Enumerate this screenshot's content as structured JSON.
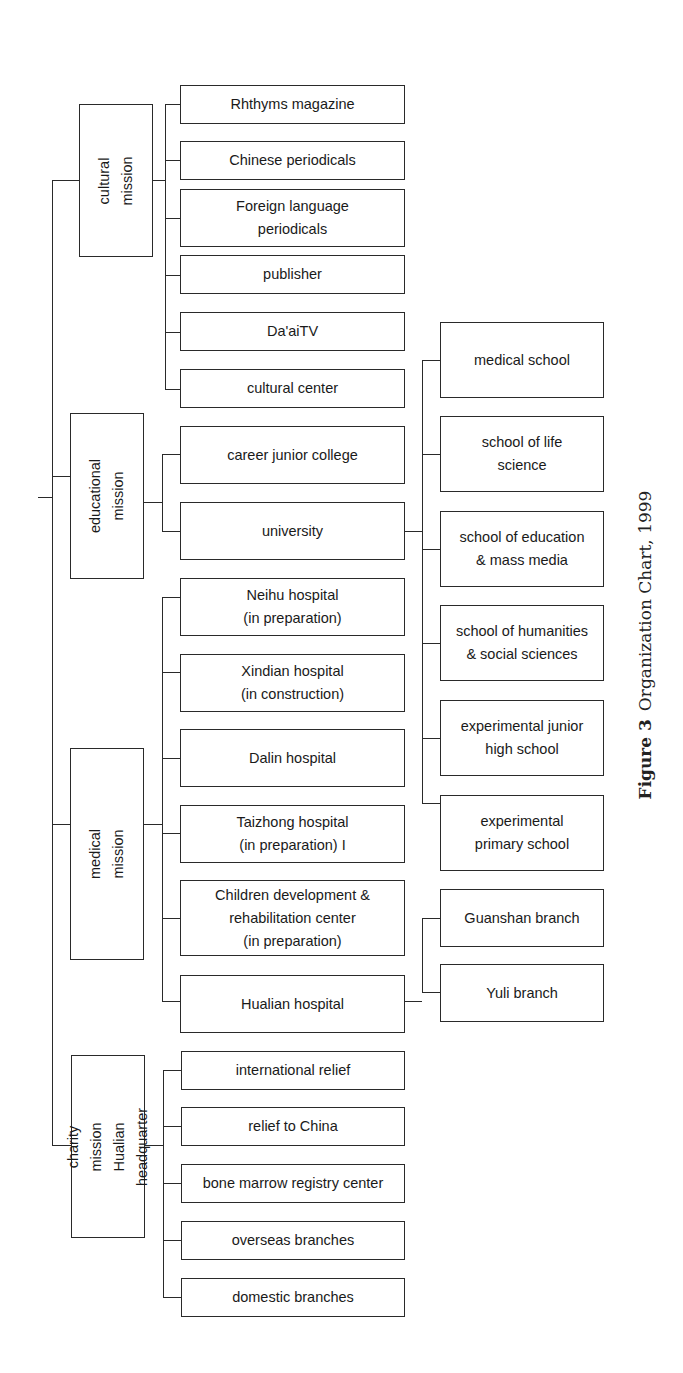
{
  "chart": {
    "caption": {
      "figure_label": "Figure 3",
      "title": "Organization Chart, 1999"
    },
    "missions": [
      {
        "id": "cultural",
        "label": "cultural mission",
        "children": [
          "Rhthyms magazine",
          "Chinese periodicals",
          "Foreign language\nperiodicals",
          "publisher",
          "Da'aiTV",
          "cultural center"
        ]
      },
      {
        "id": "educational",
        "label": "educational mission",
        "children": [
          "career junior college",
          "university"
        ]
      },
      {
        "id": "medical",
        "label": "medical mission",
        "children": [
          "Neihu hospital\n(in preparation)",
          "Xindian hospital\n(in construction)",
          "Dalin hospital",
          "Taizhong hospital\n(in preparation) I",
          "Children development &\nrehabilitation center\n(in preparation)",
          "Hualian hospital"
        ]
      },
      {
        "id": "charity",
        "label": "charity mission\nHualian headquarter",
        "children": [
          "international relief",
          "relief to China",
          "bone marrow registry center",
          "overseas branches",
          "domestic branches"
        ]
      }
    ],
    "university_children": [
      "medical school",
      "school of life\nscience",
      "school of education\n& mass media",
      "school of humanities\n& social sciences",
      "experimental junior\nhigh school",
      "experimental\nprimary school"
    ],
    "hualian_children": [
      "Guanshan branch",
      "Yuli branch"
    ]
  }
}
